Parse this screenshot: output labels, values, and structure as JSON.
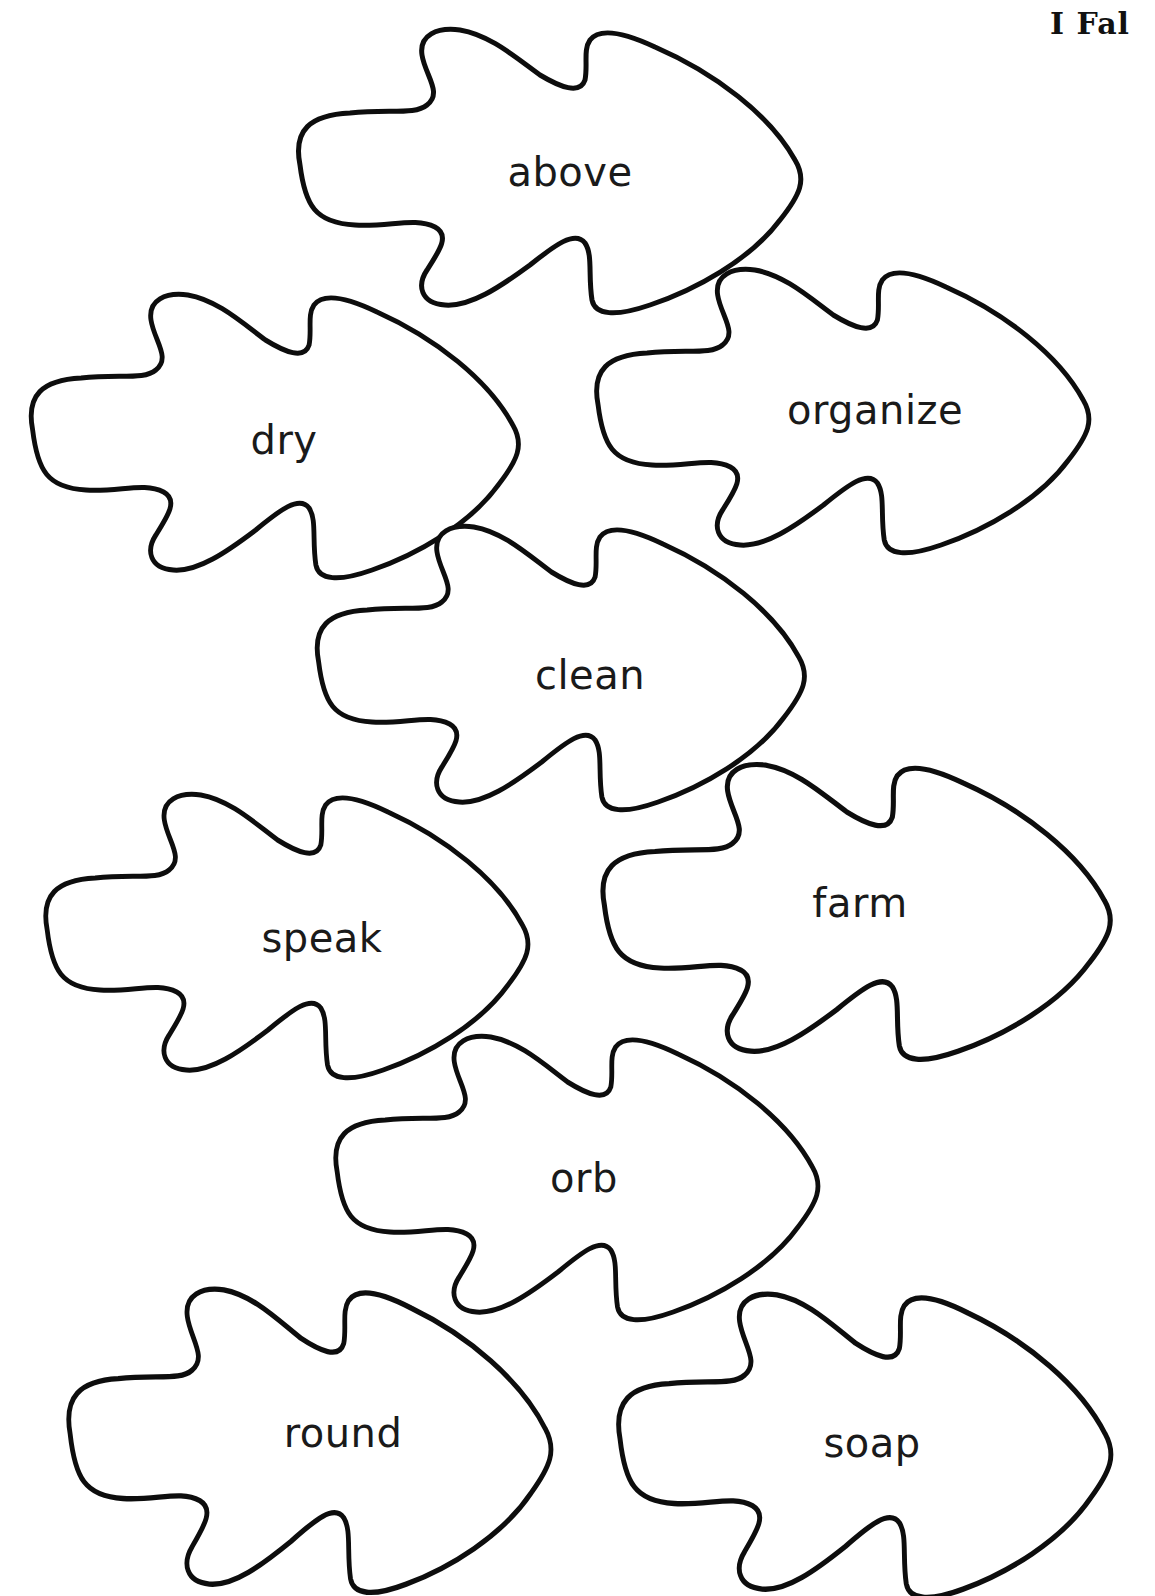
{
  "header": {
    "title": "I Fal"
  },
  "leaves": [
    {
      "word": "above",
      "cx": 555,
      "cy": 175,
      "w": 540,
      "h": 270,
      "tx": 570,
      "ty": 172
    },
    {
      "word": "dry",
      "cx": 280,
      "cy": 440,
      "w": 525,
      "h": 270,
      "tx": 284,
      "ty": 440
    },
    {
      "word": "organize",
      "cx": 848,
      "cy": 415,
      "w": 530,
      "h": 270,
      "tx": 875,
      "ty": 410
    },
    {
      "word": "clean",
      "cx": 566,
      "cy": 672,
      "w": 525,
      "h": 270,
      "tx": 590,
      "ty": 675
    },
    {
      "word": "speak",
      "cx": 292,
      "cy": 940,
      "w": 520,
      "h": 270,
      "tx": 322,
      "ty": 938
    },
    {
      "word": "farm",
      "cx": 862,
      "cy": 916,
      "w": 545,
      "h": 280,
      "tx": 860,
      "ty": 903
    },
    {
      "word": "orb",
      "cx": 582,
      "cy": 1182,
      "w": 520,
      "h": 270,
      "tx": 584,
      "ty": 1178
    },
    {
      "word": "round",
      "cx": 315,
      "cy": 1445,
      "w": 520,
      "h": 290,
      "tx": 343,
      "ty": 1433
    },
    {
      "word": "soap",
      "cx": 870,
      "cy": 1450,
      "w": 530,
      "h": 290,
      "tx": 872,
      "ty": 1443
    }
  ],
  "colors": {
    "outline": "#0d0d0d",
    "text": "#1a1a1a",
    "background": "#ffffff"
  }
}
